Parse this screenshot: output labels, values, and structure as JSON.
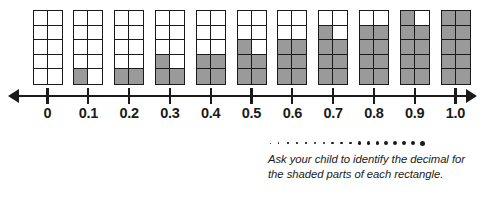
{
  "worksheet": {
    "caption": "Ask your child to identify the decimal for the shaded parts of each rectangle.",
    "shaded_color": "#9a9a9a",
    "line_color": "#1a1a1a",
    "background_color": "#ffffff"
  },
  "number_line": {
    "tick_labels": [
      "0",
      "0.1",
      "0.2",
      "0.3",
      "0.4",
      "0.5",
      "0.6",
      "0.7",
      "0.8",
      "0.9",
      "1.0"
    ],
    "left_arrow": "arrow-left",
    "right_arrow": "arrow-right",
    "min": 0,
    "max": 1.0,
    "step": 0.1
  },
  "decoration": {
    "dot_count": 18,
    "dot_min_size": 1,
    "dot_max_size": 5
  },
  "chart_data": {
    "type": "bar",
    "xlabel": "",
    "ylabel": "",
    "categories": [
      "0",
      "0.1",
      "0.2",
      "0.3",
      "0.4",
      "0.5",
      "0.6",
      "0.7",
      "0.8",
      "0.9",
      "1.0"
    ],
    "values": [
      0,
      1,
      2,
      3,
      4,
      5,
      6,
      7,
      8,
      9,
      10
    ],
    "ylim": [
      0,
      10
    ],
    "grid": true,
    "legend": "none"
  }
}
